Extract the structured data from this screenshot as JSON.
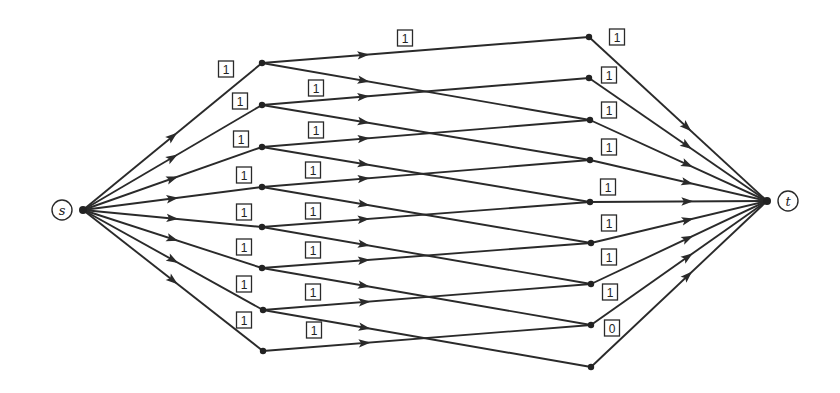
{
  "diagram": {
    "title": "",
    "source": {
      "id": "s",
      "label": "s",
      "x": 62,
      "y": 210,
      "junction_x": 83
    },
    "sink": {
      "id": "t",
      "label": "t",
      "x": 788,
      "y": 201,
      "junction_x": 767
    },
    "left_nodes": [
      {
        "id": "L1",
        "x": 262,
        "y": 63
      },
      {
        "id": "L2",
        "x": 262,
        "y": 105
      },
      {
        "id": "L3",
        "x": 262,
        "y": 147
      },
      {
        "id": "L4",
        "x": 262,
        "y": 187
      },
      {
        "id": "L5",
        "x": 262,
        "y": 227
      },
      {
        "id": "L6",
        "x": 262,
        "y": 268
      },
      {
        "id": "L7",
        "x": 263,
        "y": 310
      },
      {
        "id": "L8",
        "x": 263,
        "y": 351
      }
    ],
    "right_nodes": [
      {
        "id": "R1",
        "x": 589,
        "y": 37
      },
      {
        "id": "R2",
        "x": 589,
        "y": 78
      },
      {
        "id": "R3",
        "x": 590,
        "y": 120
      },
      {
        "id": "R4",
        "x": 590,
        "y": 160
      },
      {
        "id": "R5",
        "x": 590,
        "y": 202
      },
      {
        "id": "R6",
        "x": 591,
        "y": 243
      },
      {
        "id": "R7",
        "x": 591,
        "y": 284
      },
      {
        "id": "R8",
        "x": 591,
        "y": 325
      },
      {
        "id": "R9",
        "x": 591,
        "y": 367
      }
    ],
    "edges": [
      {
        "from": "s",
        "to": "L1",
        "flow": "1",
        "label_x": 226,
        "label_y": 69
      },
      {
        "from": "s",
        "to": "L2",
        "flow": "1",
        "label_x": 240,
        "label_y": 101
      },
      {
        "from": "s",
        "to": "L3",
        "flow": "1",
        "label_x": 241,
        "label_y": 139
      },
      {
        "from": "s",
        "to": "L4",
        "flow": "1",
        "label_x": 244,
        "label_y": 175
      },
      {
        "from": "s",
        "to": "L5",
        "flow": "1",
        "label_x": 244,
        "label_y": 212
      },
      {
        "from": "s",
        "to": "L6",
        "flow": "1",
        "label_x": 244,
        "label_y": 247
      },
      {
        "from": "s",
        "to": "L7",
        "flow": "1",
        "label_x": 244,
        "label_y": 284
      },
      {
        "from": "s",
        "to": "L8",
        "flow": "1",
        "label_x": 244,
        "label_y": 320
      },
      {
        "from": "L1",
        "to": "R1",
        "flow": "1",
        "label_x": 405,
        "label_y": 38
      },
      {
        "from": "L1",
        "to": "R3",
        "flow": null
      },
      {
        "from": "L2",
        "to": "R2",
        "flow": "1",
        "label_x": 316,
        "label_y": 88
      },
      {
        "from": "L2",
        "to": "R4",
        "flow": null
      },
      {
        "from": "L3",
        "to": "R3",
        "flow": "1",
        "label_x": 316,
        "label_y": 130
      },
      {
        "from": "L3",
        "to": "R5",
        "flow": null
      },
      {
        "from": "L4",
        "to": "R4",
        "flow": "1",
        "label_x": 313,
        "label_y": 170
      },
      {
        "from": "L4",
        "to": "R6",
        "flow": null
      },
      {
        "from": "L5",
        "to": "R5",
        "flow": "1",
        "label_x": 313,
        "label_y": 211
      },
      {
        "from": "L5",
        "to": "R7",
        "flow": null
      },
      {
        "from": "L6",
        "to": "R6",
        "flow": "1",
        "label_x": 313,
        "label_y": 250
      },
      {
        "from": "L6",
        "to": "R8",
        "flow": null
      },
      {
        "from": "L7",
        "to": "R7",
        "flow": "1",
        "label_x": 313,
        "label_y": 292
      },
      {
        "from": "L7",
        "to": "R9",
        "flow": null
      },
      {
        "from": "L8",
        "to": "R8",
        "flow": "1",
        "label_x": 314,
        "label_y": 330
      },
      {
        "from": "R1",
        "to": "t",
        "flow": "1",
        "label_x": 617,
        "label_y": 37
      },
      {
        "from": "R2",
        "to": "t",
        "flow": "1",
        "label_x": 609,
        "label_y": 75
      },
      {
        "from": "R3",
        "to": "t",
        "flow": "1",
        "label_x": 609,
        "label_y": 110
      },
      {
        "from": "R4",
        "to": "t",
        "flow": "1",
        "label_x": 609,
        "label_y": 147
      },
      {
        "from": "R5",
        "to": "t",
        "flow": "1",
        "label_x": 608,
        "label_y": 187
      },
      {
        "from": "R6",
        "to": "t",
        "flow": "1",
        "label_x": 609,
        "label_y": 223
      },
      {
        "from": "R7",
        "to": "t",
        "flow": "1",
        "label_x": 609,
        "label_y": 257
      },
      {
        "from": "R8",
        "to": "t",
        "flow": "1",
        "label_x": 610,
        "label_y": 292
      },
      {
        "from": "R9",
        "to": "t",
        "flow": "0",
        "label_x": 612,
        "label_y": 328
      }
    ],
    "colors": {
      "ink": "#2a2a2a",
      "background": "#ffffff"
    }
  }
}
